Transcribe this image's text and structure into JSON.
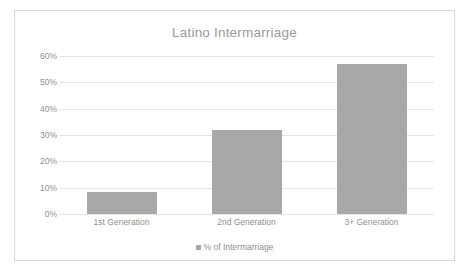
{
  "chart_data": {
    "type": "bar",
    "title": "Latino Intermarriage",
    "categories": [
      "1st Generation",
      "2nd Generation",
      "3+ Generation"
    ],
    "values": [
      8.5,
      32,
      57
    ],
    "series": [
      {
        "name": "% of Intermarriage",
        "values": [
          8.5,
          32,
          57
        ]
      }
    ],
    "xlabel": "",
    "ylabel": "",
    "ylim": [
      0,
      60
    ],
    "ytick_labels": [
      "0%",
      "10%",
      "20%",
      "30%",
      "40%",
      "50%",
      "60%"
    ],
    "ytick_values": [
      0,
      10,
      20,
      30,
      40,
      50,
      60
    ],
    "grid": true,
    "legend": {
      "position": "bottom",
      "entries": [
        "% of Intermarriage"
      ]
    },
    "colors": {
      "bar": "#a8a8a8",
      "gridline": "#e4e4e4",
      "text": "#8f8f8f",
      "title_text": "#9a9a9a",
      "frame_border": "#d9d9d9",
      "background": "#ffffff"
    }
  }
}
